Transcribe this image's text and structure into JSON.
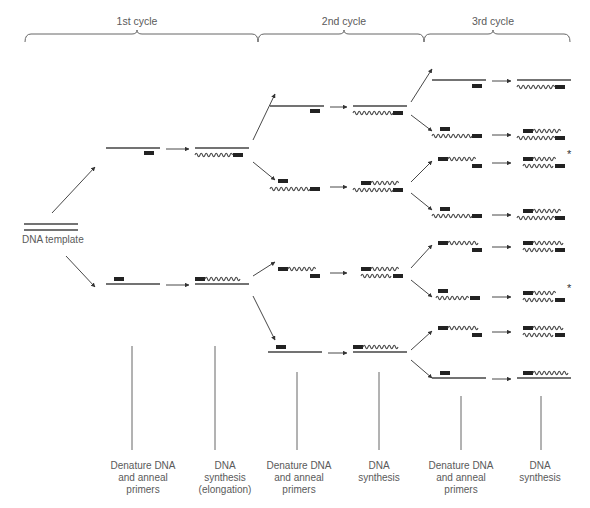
{
  "cycles": [
    {
      "label": "1st cycle",
      "x1": 25,
      "x2": 258,
      "mid": 137
    },
    {
      "label": "2nd cycle",
      "x1": 258,
      "x2": 424,
      "mid": 344
    },
    {
      "label": "3rd cycle",
      "x1": 424,
      "x2": 570,
      "mid": 493
    }
  ],
  "template": {
    "label": "DNA template",
    "x1": 24,
    "x2": 78,
    "y": 227
  },
  "step_labels": [
    {
      "x": 143,
      "lines": [
        "Denature DNA",
        "and anneal",
        "primers"
      ]
    },
    {
      "x": 225,
      "lines": [
        "DNA",
        "synthesis",
        "(elongation)"
      ]
    },
    {
      "x": 299,
      "lines": [
        "Denature DNA",
        "and anneal",
        "primers"
      ]
    },
    {
      "x": 379,
      "lines": [
        "DNA",
        "synthesis"
      ]
    },
    {
      "x": 461,
      "lines": [
        "Denature DNA",
        "and anneal",
        "primers"
      ]
    },
    {
      "x": 540,
      "lines": [
        "DNA",
        "synthesis"
      ]
    }
  ],
  "step_lines": [
    {
      "x": 132,
      "y1": 346,
      "y2": 450
    },
    {
      "x": 215,
      "y1": 346,
      "y2": 450
    },
    {
      "x": 297,
      "y1": 372,
      "y2": 450
    },
    {
      "x": 379,
      "y1": 372,
      "y2": 450
    },
    {
      "x": 461,
      "y1": 396,
      "y2": 450
    },
    {
      "x": 541,
      "y1": 396,
      "y2": 450
    }
  ],
  "strand_legend": {
    "straight": "original template strand",
    "wavy": "newly synthesized strand",
    "box": "primer",
    "asterisk": "target-length product"
  },
  "rows": [
    {
      "id": "c1-top",
      "x": 106,
      "y": 148,
      "denature": [
        {
          "type": "line",
          "x1": 0,
          "x2": 54,
          "dy": 0
        },
        {
          "type": "box",
          "x": 38,
          "dy": 5
        }
      ],
      "synth_x": 195,
      "synth": [
        {
          "type": "line",
          "x1": 0,
          "x2": 54,
          "dy": 0
        },
        {
          "type": "wave",
          "x1": 0,
          "x2": 38,
          "dy": 7
        },
        {
          "type": "box",
          "x": 38,
          "dy": 7
        }
      ]
    },
    {
      "id": "c1-bot",
      "x": 106,
      "y": 284,
      "denature": [
        {
          "type": "box",
          "x": 8,
          "dy": -5
        },
        {
          "type": "line",
          "x1": 0,
          "x2": 54,
          "dy": 0
        }
      ],
      "synth_x": 195,
      "synth": [
        {
          "type": "box",
          "x": 0,
          "dy": -5
        },
        {
          "type": "wave",
          "x1": 10,
          "x2": 46,
          "dy": -5
        },
        {
          "type": "line",
          "x1": 0,
          "x2": 54,
          "dy": 0
        }
      ]
    },
    {
      "id": "c2-1",
      "x": 270,
      "y": 106,
      "denature": [
        {
          "type": "line",
          "x1": 0,
          "x2": 54,
          "dy": 0
        },
        {
          "type": "box",
          "x": 40,
          "dy": 5
        }
      ],
      "synth_x": 353,
      "synth": [
        {
          "type": "line",
          "x1": 0,
          "x2": 54,
          "dy": 0
        },
        {
          "type": "wave",
          "x1": 0,
          "x2": 40,
          "dy": 7
        },
        {
          "type": "box",
          "x": 40,
          "dy": 7
        }
      ]
    },
    {
      "id": "c2-2",
      "x": 270,
      "y": 186,
      "denature": [
        {
          "type": "box",
          "x": 8,
          "dy": -5
        },
        {
          "type": "wave",
          "x1": 0,
          "x2": 40,
          "dy": 3
        },
        {
          "type": "box",
          "x": 40,
          "dy": 3
        }
      ],
      "synth_x": 353,
      "synth": [
        {
          "type": "box",
          "x": 8,
          "dy": -3
        },
        {
          "type": "wave",
          "x1": 18,
          "x2": 46,
          "dy": -3
        },
        {
          "type": "wave",
          "x1": 0,
          "x2": 40,
          "dy": 4
        },
        {
          "type": "box",
          "x": 40,
          "dy": 4
        }
      ]
    },
    {
      "id": "c2-3",
      "x": 270,
      "y": 272,
      "denature": [
        {
          "type": "box",
          "x": 8,
          "dy": -3
        },
        {
          "type": "wave",
          "x1": 18,
          "x2": 46,
          "dy": -3
        },
        {
          "type": "box",
          "x": 40,
          "dy": 4
        }
      ],
      "synth_x": 353,
      "synth": [
        {
          "type": "box",
          "x": 8,
          "dy": -3
        },
        {
          "type": "wave",
          "x1": 18,
          "x2": 46,
          "dy": -3
        },
        {
          "type": "wave",
          "x1": 8,
          "x2": 40,
          "dy": 4
        },
        {
          "type": "box",
          "x": 40,
          "dy": 4
        }
      ]
    },
    {
      "id": "c2-4",
      "x": 268,
      "y": 352,
      "denature": [
        {
          "type": "box",
          "x": 8,
          "dy": -5
        },
        {
          "type": "line",
          "x1": 0,
          "x2": 54,
          "dy": 0
        }
      ],
      "synth_x": 353,
      "synth": [
        {
          "type": "box",
          "x": 0,
          "dy": -5
        },
        {
          "type": "wave",
          "x1": 10,
          "x2": 46,
          "dy": -5
        },
        {
          "type": "line",
          "x1": 0,
          "x2": 54,
          "dy": 0
        }
      ]
    },
    {
      "id": "c3-1",
      "x": 432,
      "y": 80,
      "denature": [
        {
          "type": "line",
          "x1": 0,
          "x2": 54,
          "dy": 0
        },
        {
          "type": "box",
          "x": 40,
          "dy": 6
        }
      ],
      "synth_x": 517,
      "synth": [
        {
          "type": "line",
          "x1": 0,
          "x2": 54,
          "dy": 0
        },
        {
          "type": "wave",
          "x1": 0,
          "x2": 38,
          "dy": 7
        },
        {
          "type": "box",
          "x": 38,
          "dy": 7
        }
      ]
    },
    {
      "id": "c3-2",
      "x": 432,
      "y": 134,
      "denature": [
        {
          "type": "box",
          "x": 8,
          "dy": -5
        },
        {
          "type": "wave",
          "x1": 0,
          "x2": 40,
          "dy": 2
        },
        {
          "type": "box",
          "x": 40,
          "dy": 2
        }
      ],
      "synth_x": 517,
      "synth": [
        {
          "type": "box",
          "x": 6,
          "dy": -3
        },
        {
          "type": "wave",
          "x1": 16,
          "x2": 44,
          "dy": -3
        },
        {
          "type": "wave",
          "x1": 0,
          "x2": 38,
          "dy": 4
        },
        {
          "type": "box",
          "x": 38,
          "dy": 4
        }
      ]
    },
    {
      "id": "c3-3",
      "x": 432,
      "y": 162,
      "denature": [
        {
          "type": "box",
          "x": 6,
          "dy": -3
        },
        {
          "type": "wave",
          "x1": 16,
          "x2": 44,
          "dy": -3
        },
        {
          "type": "box",
          "x": 40,
          "dy": 4
        }
      ],
      "synth_x": 517,
      "synth": [
        {
          "type": "box",
          "x": 6,
          "dy": -3
        },
        {
          "type": "wave",
          "x1": 16,
          "x2": 40,
          "dy": -3
        },
        {
          "type": "wave",
          "x1": 6,
          "x2": 38,
          "dy": 4
        },
        {
          "type": "box",
          "x": 38,
          "dy": 4
        }
      ],
      "asterisk": true
    },
    {
      "id": "c3-4",
      "x": 432,
      "y": 214,
      "denature": [
        {
          "type": "box",
          "x": 8,
          "dy": -5
        },
        {
          "type": "wave",
          "x1": 0,
          "x2": 40,
          "dy": 2
        },
        {
          "type": "box",
          "x": 40,
          "dy": 2
        }
      ],
      "synth_x": 517,
      "synth": [
        {
          "type": "box",
          "x": 6,
          "dy": -3
        },
        {
          "type": "wave",
          "x1": 16,
          "x2": 44,
          "dy": -3
        },
        {
          "type": "wave",
          "x1": 0,
          "x2": 38,
          "dy": 4
        },
        {
          "type": "box",
          "x": 38,
          "dy": 4
        }
      ]
    },
    {
      "id": "c3-5",
      "x": 432,
      "y": 246,
      "denature": [
        {
          "type": "box",
          "x": 6,
          "dy": -3
        },
        {
          "type": "wave",
          "x1": 16,
          "x2": 48,
          "dy": -3
        },
        {
          "type": "box",
          "x": 40,
          "dy": 4
        }
      ],
      "synth_x": 517,
      "synth": [
        {
          "type": "box",
          "x": 6,
          "dy": -3
        },
        {
          "type": "wave",
          "x1": 16,
          "x2": 48,
          "dy": -3
        },
        {
          "type": "wave",
          "x1": 6,
          "x2": 38,
          "dy": 4
        },
        {
          "type": "box",
          "x": 38,
          "dy": 4
        }
      ]
    },
    {
      "id": "c3-6",
      "x": 432,
      "y": 296,
      "denature": [
        {
          "type": "box",
          "x": 6,
          "dy": -5
        },
        {
          "type": "wave",
          "x1": 4,
          "x2": 38,
          "dy": 2
        },
        {
          "type": "box",
          "x": 38,
          "dy": 2
        }
      ],
      "synth_x": 517,
      "synth": [
        {
          "type": "box",
          "x": 6,
          "dy": -3
        },
        {
          "type": "wave",
          "x1": 16,
          "x2": 40,
          "dy": -3
        },
        {
          "type": "wave",
          "x1": 6,
          "x2": 38,
          "dy": 4
        },
        {
          "type": "box",
          "x": 38,
          "dy": 4
        }
      ],
      "asterisk": true
    },
    {
      "id": "c3-7",
      "x": 432,
      "y": 331,
      "denature": [
        {
          "type": "box",
          "x": 6,
          "dy": -3
        },
        {
          "type": "wave",
          "x1": 16,
          "x2": 48,
          "dy": -3
        },
        {
          "type": "box",
          "x": 40,
          "dy": 4
        }
      ],
      "synth_x": 517,
      "synth": [
        {
          "type": "box",
          "x": 6,
          "dy": -3
        },
        {
          "type": "wave",
          "x1": 16,
          "x2": 48,
          "dy": -3
        },
        {
          "type": "wave",
          "x1": 6,
          "x2": 38,
          "dy": 4
        },
        {
          "type": "box",
          "x": 38,
          "dy": 4
        }
      ]
    },
    {
      "id": "c3-8",
      "x": 432,
      "y": 378,
      "denature": [
        {
          "type": "box",
          "x": 8,
          "dy": -5
        },
        {
          "type": "line",
          "x1": 0,
          "x2": 54,
          "dy": 0
        }
      ],
      "synth_x": 517,
      "synth": [
        {
          "type": "box",
          "x": 6,
          "dy": -5
        },
        {
          "type": "wave",
          "x1": 16,
          "x2": 52,
          "dy": -5
        },
        {
          "type": "line",
          "x1": 0,
          "x2": 54,
          "dy": 0
        }
      ]
    }
  ],
  "branch_arrows": [
    {
      "x1": 52,
      "y1": 213,
      "x2": 95,
      "y2": 167
    },
    {
      "x1": 66,
      "y1": 256,
      "x2": 95,
      "y2": 287
    },
    {
      "x1": 253,
      "y1": 140,
      "x2": 275,
      "y2": 94
    },
    {
      "x1": 253,
      "y1": 162,
      "x2": 275,
      "y2": 180
    },
    {
      "x1": 253,
      "y1": 276,
      "x2": 275,
      "y2": 262
    },
    {
      "x1": 253,
      "y1": 296,
      "x2": 275,
      "y2": 340
    },
    {
      "x1": 411,
      "y1": 102,
      "x2": 432,
      "y2": 69
    },
    {
      "x1": 411,
      "y1": 115,
      "x2": 432,
      "y2": 131
    },
    {
      "x1": 411,
      "y1": 182,
      "x2": 432,
      "y2": 161
    },
    {
      "x1": 411,
      "y1": 193,
      "x2": 432,
      "y2": 210
    },
    {
      "x1": 411,
      "y1": 268,
      "x2": 432,
      "y2": 245
    },
    {
      "x1": 411,
      "y1": 280,
      "x2": 432,
      "y2": 297
    },
    {
      "x1": 411,
      "y1": 350,
      "x2": 432,
      "y2": 331
    },
    {
      "x1": 411,
      "y1": 360,
      "x2": 432,
      "y2": 378
    }
  ]
}
